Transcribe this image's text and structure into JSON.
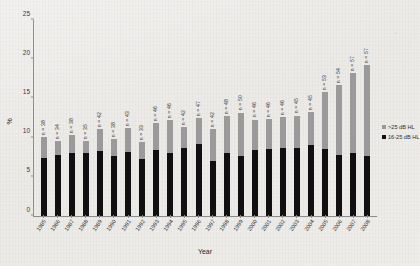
{
  "chart_data": {
    "type": "bar",
    "title": "",
    "xlabel": "Year",
    "ylabel": "%",
    "ylim": [
      0,
      25
    ],
    "yticks": [
      0,
      5,
      10,
      15,
      20,
      25
    ],
    "grid": false,
    "stacked": true,
    "legend_position": "right",
    "categories": [
      "1985",
      "1986",
      "1987",
      "1988",
      "1989",
      "1990",
      "1991",
      "1992",
      "1993",
      "1994",
      "1995",
      "1996",
      "1997",
      "1998",
      "1999",
      "2000",
      "2001",
      "2002",
      "2003",
      "2004",
      "2005",
      "2006",
      "2007",
      "2008"
    ],
    "series": [
      {
        "name": "16-25 dB HL",
        "color": "#101010",
        "values": [
          7.4,
          7.8,
          8.1,
          8.0,
          8.3,
          7.6,
          8.2,
          7.3,
          8.4,
          8.0,
          8.7,
          9.2,
          7.0,
          8.0,
          7.7,
          8.4,
          8.5,
          8.7,
          8.7,
          9.0,
          8.5,
          7.8,
          8.1,
          7.6
        ]
      },
      {
        "name": ">25 dB HL",
        "color": "#9a9a9a",
        "values": [
          2.7,
          1.8,
          2.2,
          1.6,
          2.8,
          2.2,
          3.0,
          2.1,
          3.5,
          4.2,
          2.6,
          3.3,
          4.1,
          4.7,
          5.5,
          3.9,
          3.9,
          3.9,
          4.1,
          4.3,
          7.3,
          8.9,
          10.1,
          11.7
        ]
      }
    ],
    "totals": [
      10.1,
      9.6,
      10.3,
      9.6,
      11.1,
      9.8,
      11.2,
      9.4,
      11.9,
      12.2,
      11.3,
      12.5,
      11.1,
      12.7,
      13.2,
      12.3,
      12.4,
      12.6,
      12.8,
      13.3,
      15.8,
      16.7,
      18.2,
      19.3
    ],
    "point_labels": [
      "n = 38",
      "n = 34",
      "n = 38",
      "n = 35",
      "n = 42",
      "n = 38",
      "n = 43",
      "n = 33",
      "n = 46",
      "n = 46",
      "n = 42",
      "n = 47",
      "n = 42",
      "n = 48",
      "n = 50",
      "n = 46",
      "n = 46",
      "n = 46",
      "n = 45",
      "n = 45",
      "n = 53",
      "n = 54",
      "n = 57",
      "n = 57"
    ],
    "legend": [
      {
        "label": ">25 dB HL",
        "color": "#9a9a9a",
        "swatch": "sw-gray"
      },
      {
        "label": "16-25 dB HL",
        "color": "#101010",
        "swatch": "sw-black"
      }
    ]
  }
}
